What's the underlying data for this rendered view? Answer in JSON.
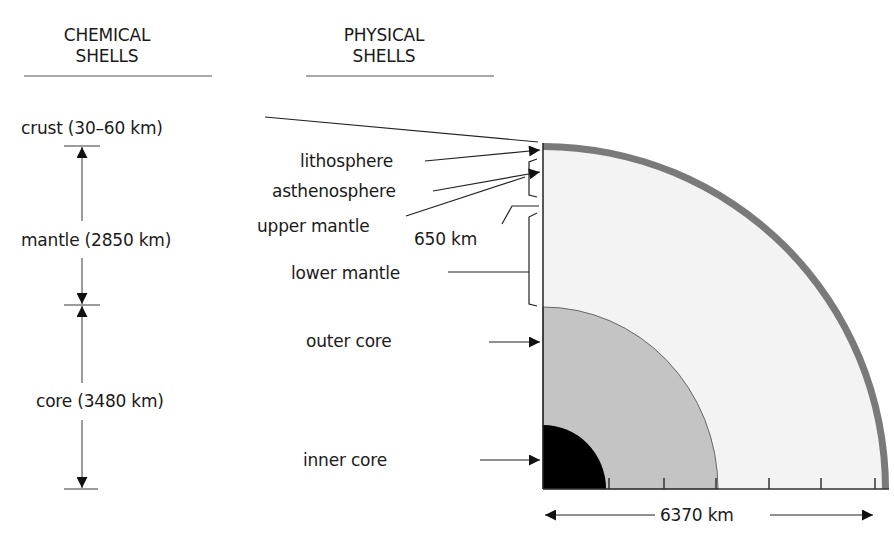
{
  "headers": {
    "chemical": {
      "line1": "CHEMICAL",
      "line2": "SHELLS"
    },
    "physical": {
      "line1": "PHYSICAL",
      "line2": "SHELLS"
    }
  },
  "chemical_shells": {
    "crust": "crust (30–60 km)",
    "mantle": "mantle (2850 km)",
    "core": "core (3480 km)"
  },
  "physical_shells": {
    "lithosphere": "lithosphere",
    "asthenosphere": "asthenosphere",
    "upper_mantle": "upper mantle",
    "depth_650": "650 km",
    "lower_mantle": "lower mantle",
    "outer_core": "outer core",
    "inner_core": "inner core"
  },
  "scale": {
    "radius_label": "6370 km"
  },
  "colors": {
    "crust": "#7a7a7a",
    "mantle": "#f3f3f3",
    "outer_core": "#c4c4c4",
    "inner_core": "#000000",
    "lines": "#222222"
  }
}
